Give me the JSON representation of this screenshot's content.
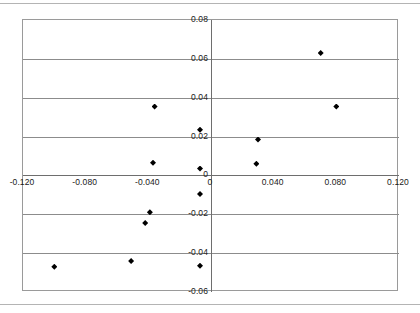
{
  "chart_data": {
    "type": "scatter",
    "title": "",
    "subtitle": "",
    "xlabel": "",
    "ylabel": "",
    "xlim": [
      -0.12,
      0.12
    ],
    "ylim": [
      -0.06,
      0.08
    ],
    "grid": true,
    "grid_axis": "y",
    "legend": false,
    "legend_position": "none",
    "marker": "diamond",
    "marker_color": "#000000",
    "x_ticks": [
      -0.12,
      -0.08,
      -0.04,
      0,
      0.04,
      0.08,
      0.12
    ],
    "x_tick_labels": [
      "-0.120",
      "-0.080",
      "-0.040",
      "0",
      "0.040",
      "0.080",
      "0.120"
    ],
    "y_ticks": [
      0.08,
      0.06,
      0.04,
      0.02,
      0,
      -0.02,
      -0.04,
      -0.06
    ],
    "y_tick_labels": [
      "0.08",
      "0.06",
      "0.04",
      "0.02",
      "0",
      "-0.02",
      "-0.04",
      "-0.06"
    ],
    "series": [
      {
        "name": "series-1",
        "points": [
          {
            "x": 0.07,
            "y": 0.063
          },
          {
            "x": 0.08,
            "y": 0.0355
          },
          {
            "x": -0.036,
            "y": 0.0355
          },
          {
            "x": -0.007,
            "y": 0.0235
          },
          {
            "x": 0.03,
            "y": 0.0185
          },
          {
            "x": -0.037,
            "y": 0.0065
          },
          {
            "x": -0.007,
            "y": 0.0035
          },
          {
            "x": 0.029,
            "y": 0.006
          },
          {
            "x": -0.007,
            "y": -0.0095
          },
          {
            "x": -0.039,
            "y": -0.019
          },
          {
            "x": -0.042,
            "y": -0.0245
          },
          {
            "x": -0.007,
            "y": -0.0465
          },
          {
            "x": -0.051,
            "y": -0.044
          },
          {
            "x": -0.1,
            "y": -0.047
          }
        ]
      }
    ]
  },
  "axes": {
    "x_axis_name": "horizontal-axis",
    "y_axis_name": "vertical-axis"
  }
}
